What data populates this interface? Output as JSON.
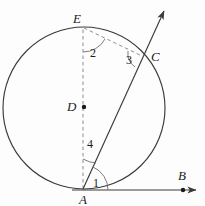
{
  "figure": {
    "background_color": "#fdfdfd",
    "line_color": "#3a3a3a",
    "dash_color": "#8d8d8d",
    "label_color": "#1b1b1b"
  },
  "points": {
    "A": {
      "label": "A",
      "x": 83,
      "y": 189,
      "label_x": 80,
      "label_y": 203
    },
    "B": {
      "label": "B",
      "x": 183,
      "y": 190,
      "label_x": 177,
      "label_y": 180
    },
    "C": {
      "label": "C",
      "x": 143,
      "y": 56,
      "label_x": 148,
      "label_y": 61
    },
    "D": {
      "label": "D",
      "x": 84,
      "y": 107,
      "label_x": 68,
      "label_y": 111
    },
    "E": {
      "label": "E",
      "x": 83,
      "y": 27,
      "label_x": 77,
      "label_y": 23
    }
  },
  "angles": {
    "one": {
      "label": "1",
      "x": 93,
      "y": 186
    },
    "two": {
      "label": "2",
      "x": 93,
      "y": 52
    },
    "three": {
      "label": "3",
      "x": 127,
      "y": 63
    },
    "four": {
      "label": "4",
      "x": 88,
      "y": 148
    }
  },
  "circle": {
    "center_x": 84,
    "center_y": 108,
    "radius": 81
  },
  "segments": [
    {
      "name": "ray-AB",
      "from": "A",
      "to": "B",
      "style": "solid",
      "arrow": true
    },
    {
      "name": "ray-AC",
      "from": "A",
      "to": "C",
      "style": "solid",
      "arrow": true
    },
    {
      "name": "diameter-AE",
      "from": "A",
      "to": "E",
      "style": "dashed",
      "arrow": false
    },
    {
      "name": "chord-EC",
      "from": "E",
      "to": "C",
      "style": "dashed",
      "arrow": false
    }
  ]
}
